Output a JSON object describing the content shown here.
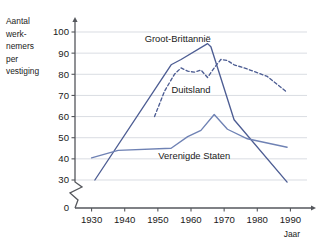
{
  "chart_data": {
    "type": "line",
    "title": "",
    "xlabel": "Jaar",
    "ylabel": "Aantal werk-nemers per vestiging",
    "ylabel_lines": [
      "Aantal",
      "werk-",
      "nemers",
      "per",
      "vestiging"
    ],
    "xlim": [
      1925,
      1995
    ],
    "ylim": [
      30,
      103
    ],
    "y_axis_break": true,
    "y_zero_label": "0",
    "grid": true,
    "grid_axis": "y",
    "legend_position": "inline-annotations",
    "xticks": [
      1930,
      1940,
      1950,
      1960,
      1970,
      1980,
      1990
    ],
    "xtick_labels": [
      "1930",
      "1940",
      "1950",
      "1960",
      "1970",
      "1980",
      "1990"
    ],
    "yticks": [
      30,
      40,
      50,
      60,
      70,
      80,
      90,
      100
    ],
    "ytick_labels": [
      "30",
      "40",
      "50",
      "60",
      "70",
      "80",
      "90",
      "100"
    ],
    "series": [
      {
        "name": "Groot-Brittannië",
        "style": "solid",
        "color": "#4d5d93",
        "x": [
          1931,
          1954,
          1957,
          1965,
          1966,
          1973,
          1989
        ],
        "values": [
          30,
          84.5,
          87,
          94.5,
          93,
          58.5,
          29
        ]
      },
      {
        "name": "Duitsland",
        "style": "dashed",
        "color": "#4d5d93",
        "x": [
          1949,
          1952,
          1955,
          1957,
          1959,
          1961,
          1963,
          1965,
          1967,
          1969,
          1971,
          1973,
          1977,
          1983,
          1989
        ],
        "values": [
          60,
          72,
          80,
          83,
          81.5,
          81,
          82,
          78.5,
          83,
          87,
          86.5,
          84.5,
          82.5,
          79,
          71.5
        ]
      },
      {
        "name": "Verenigde Staten",
        "style": "solid",
        "color": "#6f82b4",
        "x": [
          1930,
          1938,
          1954,
          1959,
          1963,
          1967,
          1971,
          1977,
          1989
        ],
        "values": [
          40.5,
          44,
          45,
          50.5,
          53.5,
          61,
          54,
          49.5,
          45.5
        ]
      }
    ],
    "annotations": [
      {
        "text": "Groot-Brittannië",
        "x": 1956,
        "y": 95.5
      },
      {
        "text": "Duitsland",
        "x": 1960,
        "y": 71
      },
      {
        "text": "Verenigde Staten",
        "x": 1961,
        "y": 40
      }
    ]
  }
}
